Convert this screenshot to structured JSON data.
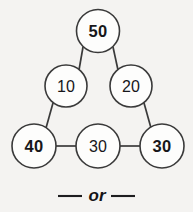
{
  "diagram": {
    "nodes": [
      {
        "id": "top",
        "label": "50",
        "weight": "bold",
        "cx": 98,
        "cy": 31,
        "r": 21.5
      },
      {
        "id": "mid-left",
        "label": "10",
        "weight": "regular",
        "cx": 66,
        "cy": 86,
        "r": 21.0
      },
      {
        "id": "mid-right",
        "label": "20",
        "weight": "regular",
        "cx": 131,
        "cy": 86,
        "r": 21.0
      },
      {
        "id": "bottom-left",
        "label": "40",
        "weight": "bold",
        "cx": 34,
        "cy": 146,
        "r": 22.0
      },
      {
        "id": "bottom-mid",
        "label": "30",
        "weight": "regular",
        "cx": 98,
        "cy": 146,
        "r": 22.0
      },
      {
        "id": "bottom-right",
        "label": "30",
        "weight": "bold",
        "cx": 162,
        "cy": 146,
        "r": 22.0
      }
    ],
    "edges": [
      {
        "id": "top-to-mid-left",
        "from": "top",
        "to": "mid-left",
        "x1": 83,
        "y1": 47,
        "x2": 79,
        "y2": 70
      },
      {
        "id": "top-to-mid-right",
        "from": "top",
        "to": "mid-right",
        "x1": 113,
        "y1": 47,
        "x2": 118,
        "y2": 70
      },
      {
        "id": "mid-left-to-bottom-left",
        "from": "mid-left",
        "to": "bottom-left",
        "x1": 53,
        "y1": 103,
        "x2": 46,
        "y2": 128
      },
      {
        "id": "mid-right-to-bottom-right",
        "from": "mid-right",
        "to": "bottom-right",
        "x1": 144,
        "y1": 103,
        "x2": 151,
        "y2": 128
      },
      {
        "id": "bottom-left-to-bottom-mid",
        "from": "bottom-left",
        "to": "bottom-mid",
        "x1": 56,
        "y1": 146,
        "x2": 76,
        "y2": 146
      },
      {
        "id": "bottom-mid-to-bottom-right",
        "from": "bottom-mid",
        "to": "bottom-right",
        "x1": 120,
        "y1": 146,
        "x2": 140,
        "y2": 146
      }
    ]
  },
  "footer": {
    "or_label": "or",
    "rule_left": {
      "x1": 58,
      "y1": 196,
      "x2": 82,
      "y2": 196
    },
    "rule_right": {
      "x1": 111,
      "y1": 196,
      "x2": 135,
      "y2": 196
    },
    "text_x": 97,
    "text_y": 195
  },
  "colors": {
    "background": "#f4f3f1",
    "circle_fill": "#fdfdfc",
    "stroke": "#3a3a3a",
    "text": "#17171a"
  }
}
